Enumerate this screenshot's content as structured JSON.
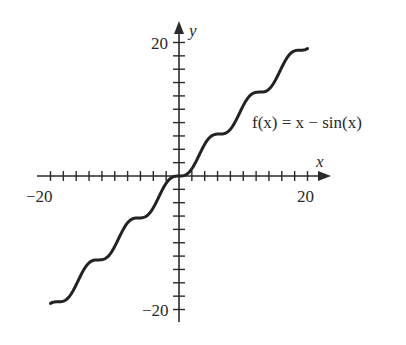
{
  "chart_data": {
    "type": "line",
    "title": "",
    "function": "f(x) = x - sin(x)",
    "annotation": "f(x) = x − sin(x)",
    "xlabel": "x",
    "ylabel": "y",
    "xlim": [
      -20,
      20
    ],
    "ylim": [
      -20,
      20
    ],
    "x_tick_step": 2,
    "y_tick_step": 2,
    "x_tick_labels": [
      "−20",
      "20"
    ],
    "y_tick_labels": [
      "20",
      "−20"
    ],
    "grid": false,
    "legend": null,
    "series": [
      {
        "name": "f(x) = x − sin(x)",
        "x": [
          -20,
          -15,
          -10,
          -5,
          0,
          5,
          10,
          15,
          20
        ],
        "values": [
          -19.09,
          -14.35,
          -10.54,
          -5.96,
          0,
          5.96,
          10.54,
          14.35,
          19.09
        ]
      }
    ],
    "color": "#222222"
  },
  "labels": {
    "x_axis": "x",
    "y_axis": "y",
    "x_min": "−20",
    "x_max": "20",
    "y_max": "20",
    "y_min": "−20",
    "function_label": "f(x) = x − sin(x)"
  }
}
